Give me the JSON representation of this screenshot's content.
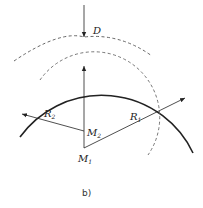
{
  "diagram": {
    "caption": "b)",
    "labels": {
      "D": "D",
      "R1": "R",
      "R1_sub": "1",
      "R2": "R",
      "R2_sub": "2",
      "M1": "M",
      "M1_sub": "1",
      "M2": "M",
      "M2_sub": "2"
    },
    "elements": [
      {
        "name": "outer-solid-arc",
        "style": "solid",
        "center": "M1",
        "radius_label": "R1"
      },
      {
        "name": "inner-dashed-arc",
        "style": "dashed",
        "center": "M2"
      },
      {
        "name": "outer-dashed-arc",
        "style": "dashed",
        "offset_label": "D"
      },
      {
        "name": "radius-R1-arrow",
        "from": "M1",
        "to": "outer-solid-arc"
      },
      {
        "name": "radius-R2-arrow",
        "from": "M2",
        "to": "outer-solid-arc"
      },
      {
        "name": "vertical-axis-arrow",
        "from": "M1",
        "to": "inner-dashed-arc"
      },
      {
        "name": "D-arrow",
        "direction": "down",
        "to": "outer-dashed-arc"
      }
    ],
    "colors": {
      "line": "#222222",
      "dashed": "#555555",
      "background": "#ffffff"
    }
  }
}
